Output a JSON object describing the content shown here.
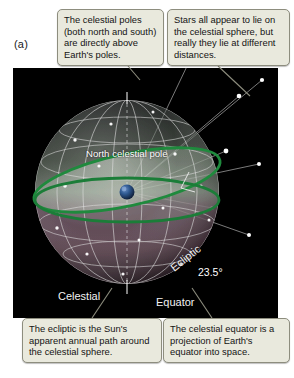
{
  "figure": {
    "panel_letter": "(a)",
    "background_color": "#ffffff",
    "sky_color": "#000000"
  },
  "callouts": [
    {
      "id": "poles",
      "text": "The celestial poles (both north and south) are directly above Earth's poles.",
      "fill": "#e9e9dd",
      "border": "#8d8d7e"
    },
    {
      "id": "stars",
      "text": "Stars all appear to lie on the celestial sphere, but really they lie at different distances.",
      "fill": "#e9e9dd",
      "border": "#8d8d7e"
    },
    {
      "id": "ecliptic",
      "text": "The ecliptic is the Sun's apparent annual path around the celestial sphere.",
      "fill": "#e9e9dd",
      "border": "#8d8d7e"
    },
    {
      "id": "equator",
      "text": "The celestial equator is a projection of Earth's equator into space.",
      "fill": "#e9e9dd",
      "border": "#8d8d7e"
    }
  ],
  "sky_labels": {
    "north_celestial_pole": "North celestial pole",
    "south_celestial_pole": "South celestial pole"
  },
  "sphere_labels": {
    "celestial": "Celestial",
    "equator": "Equator",
    "ecliptic": "Ecliptic",
    "tilt_angle": "23.5°"
  },
  "colors": {
    "ecliptic_green": "#1f8a3d",
    "equator_green": "#1b7d38",
    "sphere_tint_upper": "#8d9a8c",
    "sphere_tint_lower": "#7b5f6b",
    "grid_line": "#d8d8d8",
    "star": "#ffffff",
    "earth_blue": "#2a4a78"
  }
}
